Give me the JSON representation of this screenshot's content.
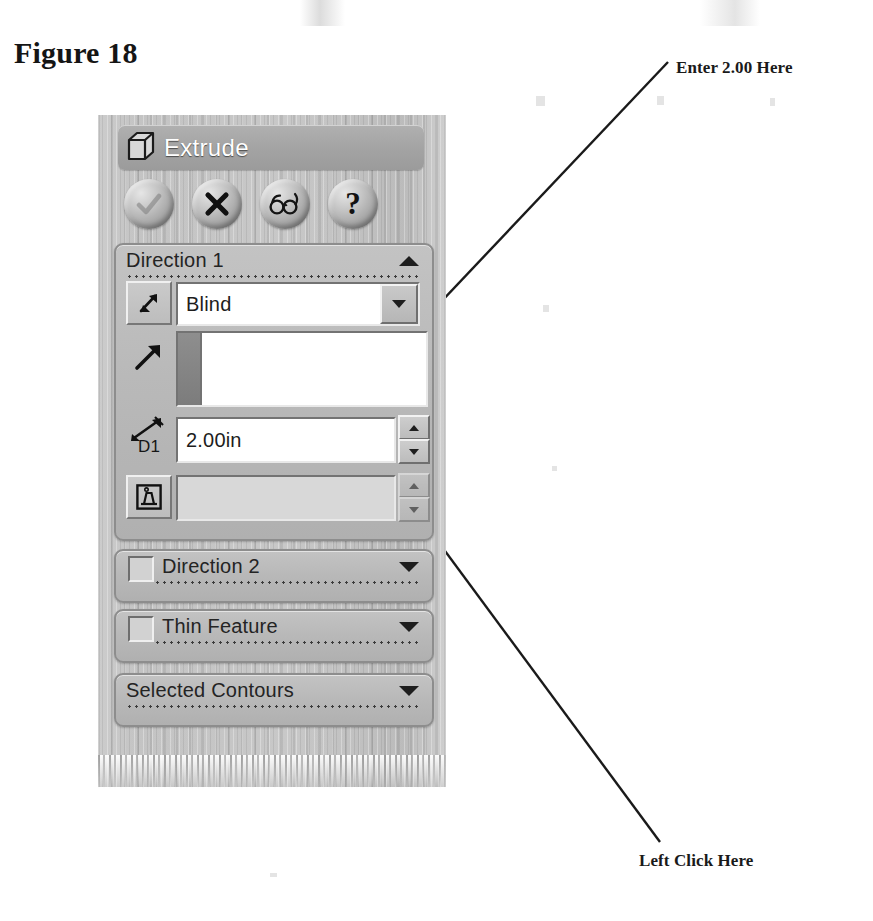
{
  "figure": {
    "caption": "Figure 18"
  },
  "annotations": [
    {
      "id": "enter-value",
      "label": "Enter 2.00 Here",
      "points_to": "depth-value-field"
    },
    {
      "id": "left-click",
      "label": "Left Click Here",
      "points_to": "ok-button"
    }
  ],
  "property_manager": {
    "title": "Extrude",
    "title_icon": "extrude-cube-icon",
    "buttons": [
      {
        "name": "ok-button",
        "icon": "check-icon",
        "tooltip": "OK"
      },
      {
        "name": "cancel-button",
        "icon": "x-icon",
        "tooltip": "Cancel"
      },
      {
        "name": "preview-button",
        "icon": "eyeglasses-icon",
        "tooltip": "Detailed Preview"
      },
      {
        "name": "help-button",
        "icon": "question-mark-icon",
        "tooltip": "Help"
      }
    ],
    "sections": [
      {
        "name": "direction-1",
        "title": "Direction 1",
        "expanded": true,
        "chevron": "chevron-up-icon",
        "has_checkbox": false,
        "rows": {
          "end_condition": {
            "flip_icon": "flip-direction-icon",
            "value": "Blind",
            "dropdown_icon": "chevron-down-icon"
          },
          "direction_reference": {
            "icon": "direction-arrow-icon",
            "value": "",
            "placeholder": ""
          },
          "depth": {
            "icon": "depth-dimension-icon",
            "icon_label": "D1",
            "value": "2.00in",
            "spinner_up": "spinner-up-icon",
            "spinner_down": "spinner-down-icon"
          },
          "draft": {
            "icon": "draft-angle-icon",
            "value": "",
            "enabled": false,
            "spinner_up": "spinner-up-icon",
            "spinner_down": "spinner-down-icon"
          }
        }
      },
      {
        "name": "direction-2",
        "title": "Direction 2",
        "expanded": false,
        "chevron": "chevron-down-icon",
        "has_checkbox": true,
        "checked": false
      },
      {
        "name": "thin-feature",
        "title": "Thin Feature",
        "expanded": false,
        "chevron": "chevron-down-icon",
        "has_checkbox": true,
        "checked": false
      },
      {
        "name": "selected-contours",
        "title": "Selected Contours",
        "expanded": false,
        "chevron": "chevron-down-icon",
        "has_checkbox": false
      }
    ]
  },
  "colors": {
    "page_background": "#ffffff",
    "panel_background": "#bcbcbc",
    "title_bar": "#a3a3a3",
    "title_text": "#ffffff",
    "group_fill": "#b9b9b9",
    "group_border": "#8d8d8d",
    "field_background": "#ffffff",
    "field_text": "#1d1d1d",
    "selection_strip": "#7c7c7c",
    "annotation_text": "#1a1a1a",
    "leader_line": "#1a1a1a"
  }
}
